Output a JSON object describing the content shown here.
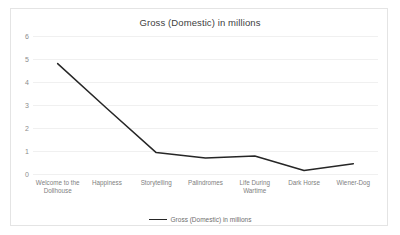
{
  "chart_data": {
    "type": "line",
    "title": "Gross (Domestic) in millions",
    "xlabel": "",
    "ylabel": "",
    "categories": [
      "Welcome to the Dollhouse",
      "Happiness",
      "Storytelling",
      "Palindromes",
      "Life During Wartime",
      "Dark Horse",
      "Wiener-Dog"
    ],
    "values": [
      4.8,
      2.85,
      0.93,
      0.7,
      0.78,
      0.15,
      0.45
    ],
    "series": [
      {
        "name": "Gross (Domestic) in millions",
        "values": [
          4.8,
          2.85,
          0.93,
          0.7,
          0.78,
          0.15,
          0.45
        ]
      }
    ],
    "ylim": [
      0,
      6
    ],
    "ytick_labels": [
      "6",
      "5",
      "4",
      "3",
      "2",
      "1",
      "0"
    ],
    "ytick_values": [
      6,
      5,
      4,
      3,
      2,
      1,
      0
    ],
    "grid": true,
    "legend": {
      "position": "bottom",
      "entries": [
        "Gross (Domestic) in millions"
      ]
    },
    "colors": {
      "line": "#262626",
      "gridline": "#f0f0f0",
      "border": "#e4e4e4",
      "title_text": "#404040",
      "tick_text": "#8c8c8c",
      "label_text": "#808080",
      "background": "#ffffff"
    }
  }
}
